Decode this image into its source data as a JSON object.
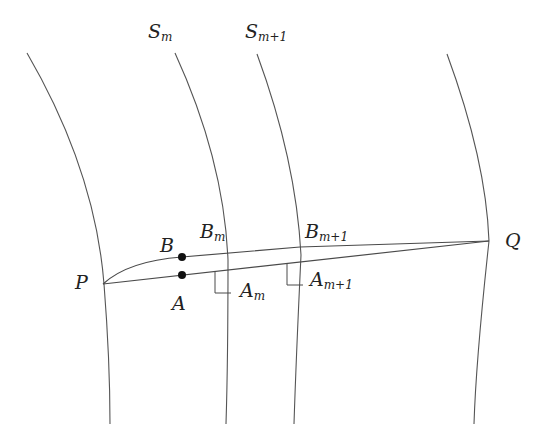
{
  "figure": {
    "surfaces": [
      {
        "id": "s0",
        "label": "",
        "path": "M27,53 Q95,170 104,284 Q110,360 110,424"
      },
      {
        "id": "sm",
        "label_main": "S",
        "label_sub": "m",
        "path": "M175,53 Q224,160 228,260 Q228,360 226,424"
      },
      {
        "id": "sm1",
        "label_main": "S",
        "label_sub": "m+1",
        "path": "M257,54 Q296,160 301,255 Q296,360 294,424"
      },
      {
        "id": "sq",
        "label": "",
        "path": "M447,54 Q486,160 489,241 Q476,360 474,424"
      }
    ],
    "lines": {
      "straight_PQ": "M103,284 L489,241",
      "curved_PBQ": "M103,284 Q130,262 182,257 L300,247 L489,241"
    },
    "right_angles": [
      {
        "id": "am",
        "path": "M215,271 L215,293 L231,293"
      },
      {
        "id": "am1",
        "path": "M287,264 L287,285 L303,285"
      }
    ],
    "points": [
      {
        "name": "B",
        "x": 182,
        "y": 257
      },
      {
        "name": "A",
        "x": 182,
        "y": 275
      }
    ],
    "labels": {
      "S_m": {
        "main": "S",
        "sub": "m"
      },
      "S_m1": {
        "main": "S",
        "sub": "m+1"
      },
      "P": "P",
      "Q": "Q",
      "A": "A",
      "B": "B",
      "B_m": {
        "main": "B",
        "sub": "m"
      },
      "B_m1": {
        "main": "B",
        "sub": "m+1"
      },
      "A_m": {
        "main": "A",
        "sub": "m"
      },
      "A_m1": {
        "main": "A",
        "sub": "m+1"
      }
    }
  }
}
